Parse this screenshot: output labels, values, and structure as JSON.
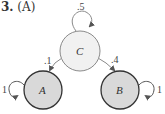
{
  "question": {
    "number": "3.",
    "answer": "(A)"
  },
  "diagram": {
    "nodes": [
      {
        "id": "C",
        "label": "C",
        "cx": 80,
        "cy": 51,
        "r": 20,
        "fill": "#f1f1f1",
        "stroke": "#8a8a8a"
      },
      {
        "id": "A",
        "label": "A",
        "cx": 43,
        "cy": 90,
        "r": 19,
        "fill": "#d9d9d9",
        "stroke": "#333333"
      },
      {
        "id": "B",
        "label": "B",
        "cx": 120,
        "cy": 90,
        "r": 19,
        "fill": "#d9d9d9",
        "stroke": "#333333"
      }
    ],
    "edges": [
      {
        "from": "C",
        "to": "C",
        "weight": ".5"
      },
      {
        "from": "C",
        "to": "A",
        "weight": ".1"
      },
      {
        "from": "C",
        "to": "B",
        "weight": ".4"
      },
      {
        "from": "A",
        "to": "A",
        "weight": "1"
      },
      {
        "from": "B",
        "to": "B",
        "weight": "1"
      }
    ],
    "colors": {
      "edge": "#8a8a8a",
      "text": "#333333"
    }
  }
}
